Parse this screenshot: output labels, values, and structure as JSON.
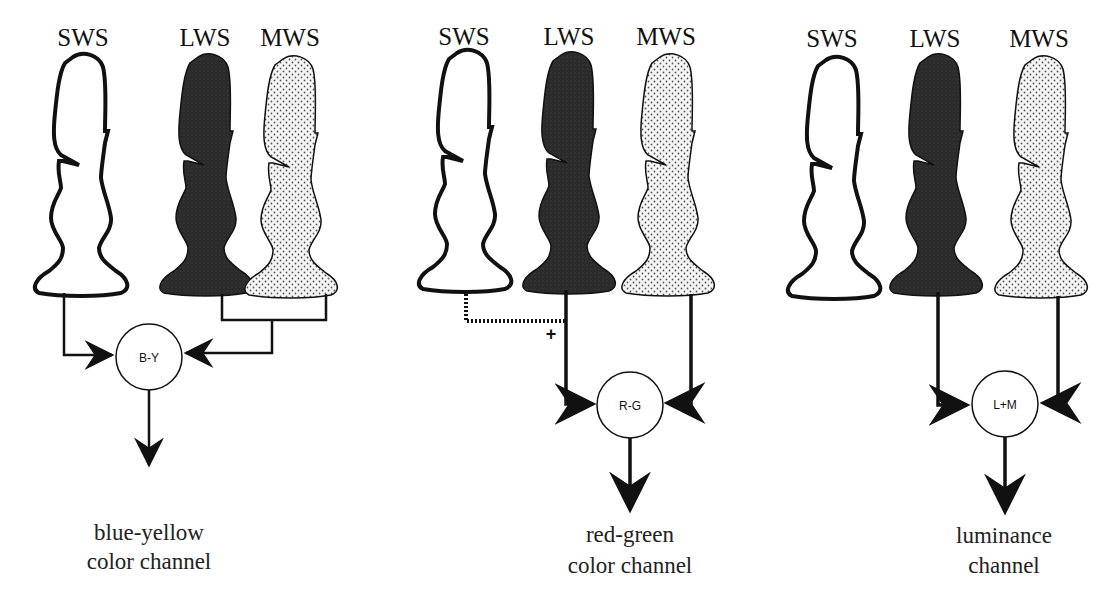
{
  "figure": {
    "colors": {
      "outline": "#111111",
      "lws_fill": "#2a2a2a",
      "mws_fill": "#f4f4f4",
      "mws_dots": "#555555",
      "sws_fill": "#ffffff"
    },
    "groups": [
      {
        "id": "blue-yellow",
        "cones": [
          {
            "label": "SWS",
            "type": "sws"
          },
          {
            "label": "LWS",
            "type": "lws"
          },
          {
            "label": "MWS",
            "type": "mws"
          }
        ],
        "node_label": "B-Y",
        "channel_line1": "blue-yellow",
        "channel_line2": "color channel"
      },
      {
        "id": "red-green",
        "cones": [
          {
            "label": "SWS",
            "type": "sws"
          },
          {
            "label": "LWS",
            "type": "lws"
          },
          {
            "label": "MWS",
            "type": "mws"
          }
        ],
        "node_label": "R-G",
        "plus_sign": "+",
        "channel_line1": "red-green",
        "channel_line2": "color channel"
      },
      {
        "id": "luminance",
        "cones": [
          {
            "label": "SWS",
            "type": "sws"
          },
          {
            "label": "LWS",
            "type": "lws"
          },
          {
            "label": "MWS",
            "type": "mws"
          }
        ],
        "node_label": "L+M",
        "channel_line1": "luminance",
        "channel_line2": "channel"
      }
    ]
  }
}
